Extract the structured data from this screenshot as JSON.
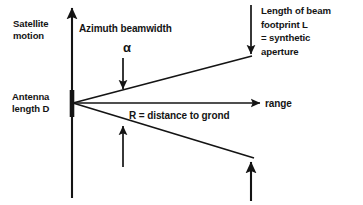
{
  "figure": {
    "type": "diagram",
    "background_color": "#ffffff",
    "ink_color": "#141414"
  },
  "labels": {
    "satellite_motion": "Satellite\nmotion",
    "azimuth_beamwidth": "Azimuth beamwidth",
    "alpha": "α",
    "antenna_length": "Antenna\nlength D",
    "range": "range",
    "distance_to_ground": "R = distance to grond",
    "beam_footprint": "Length of beam\nfootprint L\n= synthetic\naperture"
  },
  "geometry": {
    "vertex": {
      "x": 73,
      "y": 103
    },
    "axis_vertical": {
      "x": 72,
      "y_top": 6,
      "y_bottom": 198,
      "arrow": "up"
    },
    "axis_range": {
      "y": 103,
      "x_start": 73,
      "x_end": 262,
      "arrow": "right"
    },
    "antenna_segment": {
      "x": 72,
      "y_top": 90,
      "y_bottom": 117,
      "thickness": 4
    },
    "beam_upper": {
      "x1": 73,
      "y1": 103,
      "x2": 252,
      "y2": 56
    },
    "beam_lower": {
      "x1": 73,
      "y1": 103,
      "x2": 254,
      "y2": 158
    },
    "arrow_footprint_down": {
      "x": 251,
      "y_start": 5,
      "y_end": 56
    },
    "arrow_alpha_down": {
      "x": 123,
      "y_start": 58,
      "y_end": 91
    },
    "arrow_left_up": {
      "x": 123,
      "y_start": 167,
      "y_end": 124
    },
    "arrow_right_up": {
      "x": 251,
      "y_start": 201,
      "y_end": 160
    }
  }
}
